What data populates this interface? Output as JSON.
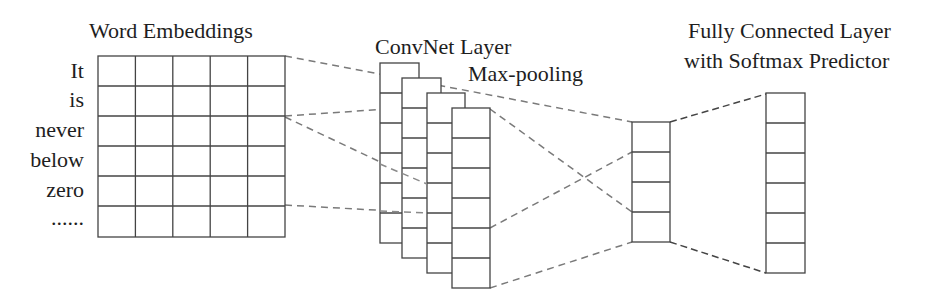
{
  "titles": {
    "embeddings": "Word Embeddings",
    "convnet": "ConvNet Layer",
    "maxpool": "Max-pooling",
    "fc_line1": "Fully Connected Layer",
    "fc_line2": "with Softmax Predictor"
  },
  "words": [
    "It",
    "is",
    "never",
    "below",
    "zero",
    "......"
  ],
  "embedding_grid": {
    "rows": 6,
    "cols": 5
  },
  "conv_filters": {
    "count": 4,
    "cells_each": 6
  },
  "maxpool_cells": 4,
  "fc_cells": 6,
  "colors": {
    "stroke": "#444444",
    "dash": "#777777"
  }
}
